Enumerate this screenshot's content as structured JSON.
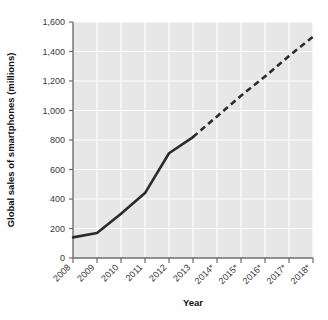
{
  "chart_data": {
    "type": "line",
    "title": "",
    "xlabel": "Year",
    "ylabel": "Global sales of smartphones (millions)",
    "categories": [
      "2008",
      "2009",
      "2010",
      "2011",
      "2012",
      "2013",
      "2014*",
      "2015*",
      "2016*",
      "2017*",
      "2018*"
    ],
    "values": [
      140,
      170,
      300,
      440,
      710,
      820,
      960,
      1100,
      1230,
      1370,
      1500
    ],
    "series": [
      {
        "name": "Global sales of smartphones (millions)",
        "values": [
          140,
          170,
          300,
          440,
          710,
          820,
          960,
          1100,
          1230,
          1370,
          1500
        ]
      }
    ],
    "actual_through_index": 5,
    "projected_from_index": 5,
    "ylim": [
      0,
      1600
    ],
    "ytick_values": [
      0,
      200,
      400,
      600,
      800,
      1000,
      1200,
      1400,
      1600
    ],
    "ytick_labels": [
      "0",
      "200",
      "400",
      "600",
      "800",
      "1,000",
      "1,200",
      "1,400",
      "1,600"
    ],
    "grid": true,
    "legend": "none",
    "line_style_actual": "solid",
    "line_style_projection": "dashed",
    "note": "* denotes projected values",
    "colors": {
      "line": "#2b2b2b",
      "plot_background": "#e7e7e7",
      "gridline": "#ffffff",
      "axis": "#6e6e6e",
      "tick_text": "#3a3a3a",
      "axis_title": "#111111",
      "page_background": "#ffffff"
    }
  }
}
